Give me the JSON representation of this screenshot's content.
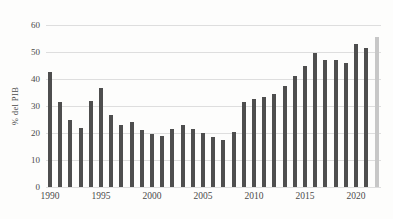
{
  "chart": {
    "y_axis_title": "% del PIB"
  },
  "chart_data": {
    "type": "bar",
    "title": "",
    "xlabel": "",
    "ylabel": "% del PIB",
    "x": [
      1990,
      1991,
      1992,
      1993,
      1994,
      1995,
      1996,
      1997,
      1998,
      1999,
      2000,
      2001,
      2002,
      2003,
      2004,
      2005,
      2006,
      2007,
      2008,
      2009,
      2010,
      2011,
      2012,
      2013,
      2014,
      2015,
      2016,
      2017,
      2018,
      2019,
      2020,
      2021,
      2022
    ],
    "values": [
      42.5,
      31.5,
      25,
      22,
      32,
      36.5,
      26.5,
      23,
      24,
      21,
      19.5,
      19,
      21.5,
      23,
      21.5,
      20,
      18.5,
      17.5,
      20.5,
      31.5,
      32.5,
      33.5,
      34.5,
      37.5,
      41,
      45,
      49.5,
      47,
      47,
      46,
      53,
      51.5,
      55.5
    ],
    "ylim": [
      0,
      60
    ],
    "yticks": [
      0,
      10,
      20,
      30,
      40,
      50,
      60
    ],
    "xticks": [
      1990,
      1995,
      2000,
      2005,
      2010,
      2015,
      2020
    ],
    "grid": "horizontal",
    "legend": "none",
    "bar_color": "#4e4e4e",
    "highlight_x": 2022,
    "highlight_color": "#c7c7c7"
  }
}
